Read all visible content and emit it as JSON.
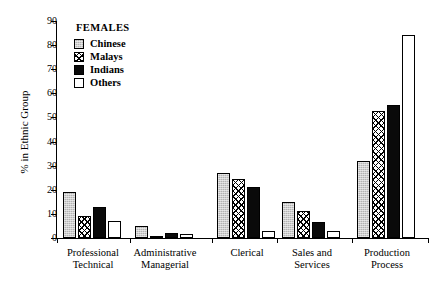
{
  "chart_data": {
    "type": "bar",
    "title": "",
    "xlabel": "",
    "ylabel": "% in Ethnic Group",
    "ylim": [
      0,
      90
    ],
    "ytick_step": 10,
    "grid": false,
    "legend_position": "top-left",
    "legend_title": "FEMALES",
    "categories": [
      "Professional\nTechnical",
      "Administrative\nManagerial",
      "Clerical",
      "Sales  and\nServices",
      "Production\nProcess"
    ],
    "yticks": [
      "0",
      "10",
      "20",
      "30",
      "40",
      "50",
      "60",
      "70",
      "80",
      "90"
    ],
    "series": [
      {
        "name": "Chinese",
        "fill": "light-grey-stipple",
        "color": "#b3b3b3",
        "values": [
          19,
          5,
          27,
          15,
          32
        ]
      },
      {
        "name": "Malays",
        "fill": "cross-hatch",
        "color": "#ffffff",
        "values": [
          9,
          1,
          24.5,
          11,
          52.5
        ]
      },
      {
        "name": "Indians",
        "fill": "solid-black",
        "color": "#0a0a0a",
        "values": [
          13,
          2,
          21,
          6.5,
          55
        ]
      },
      {
        "name": "Others",
        "fill": "empty-white",
        "color": "#ffffff",
        "values": [
          7,
          1.5,
          3,
          3,
          84
        ]
      }
    ]
  }
}
